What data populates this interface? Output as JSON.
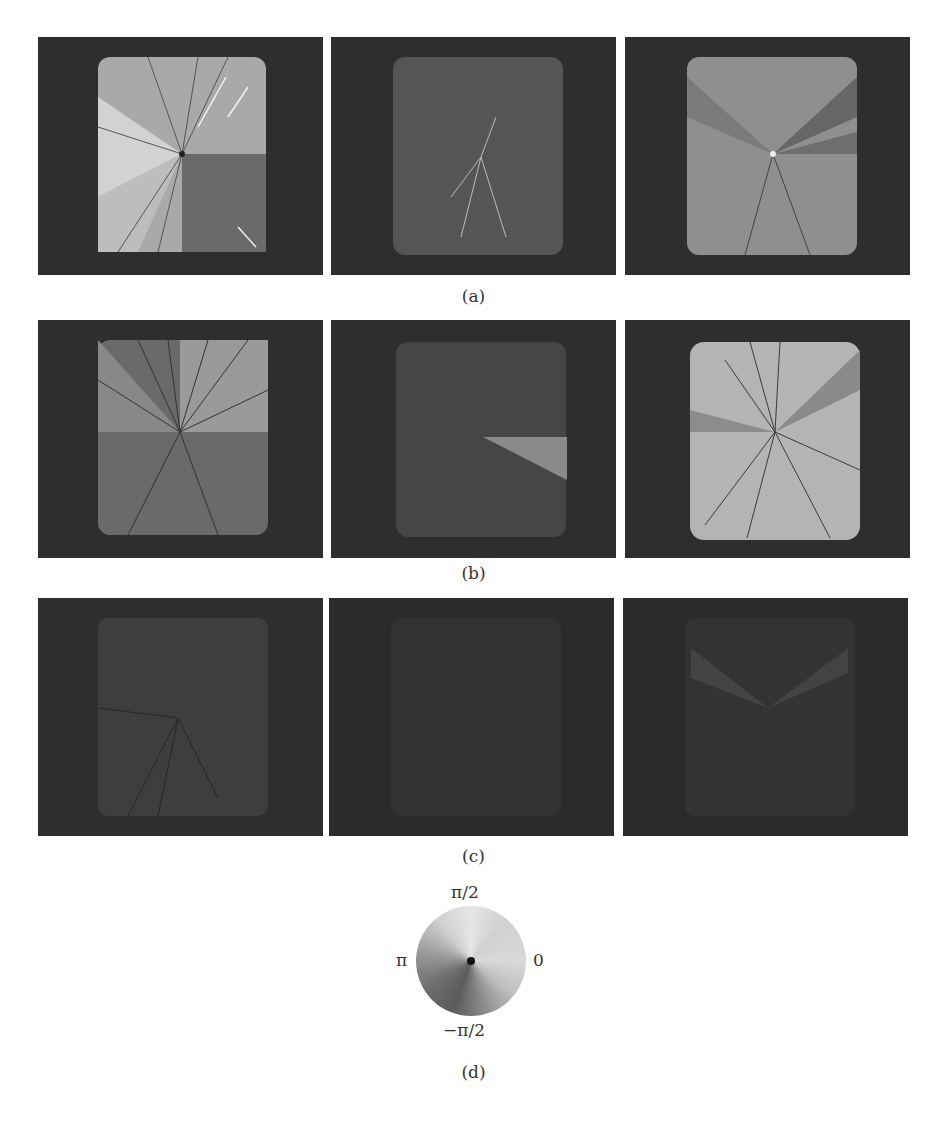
{
  "figure": {
    "rows": [
      {
        "caption": "(a)",
        "panels": [
          {
            "position": "left",
            "description": "bright square with radial spokes, light upper-left sectors, darker lower-right quadrant"
          },
          {
            "position": "middle",
            "description": "dim square with faint white radial spokes near center"
          },
          {
            "position": "right",
            "description": "medium-gray square with darker upper-right wedges and spokes"
          }
        ]
      },
      {
        "caption": "(b)",
        "panels": [
          {
            "position": "left",
            "description": "gray square with dark radial spokes, lighter upper-right quadrant, darker bottom"
          },
          {
            "position": "middle",
            "description": "dark square with a light wedge to the right of center"
          },
          {
            "position": "right",
            "description": "bright square with many dark radial spokes and darker upper-right wedges"
          }
        ]
      },
      {
        "caption": "(c)",
        "panels": [
          {
            "position": "left",
            "description": "very dim square with faint dark spokes"
          },
          {
            "position": "middle",
            "description": "almost uniformly dark panel"
          },
          {
            "position": "right",
            "description": "dark panel with faint V-shaped lighter wedges at top"
          }
        ]
      }
    ],
    "phase_wheel": {
      "caption": "(d)",
      "labels": {
        "top": "π/2",
        "right": "0",
        "left": "π",
        "bottom": "−π/2"
      }
    }
  }
}
